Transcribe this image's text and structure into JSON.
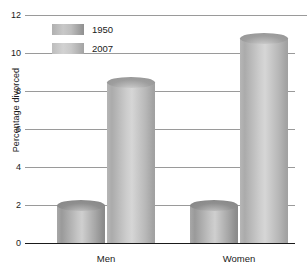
{
  "chart_data": {
    "type": "bar",
    "title": "",
    "subtitle": "",
    "xlabel": "",
    "ylabel": "Percentage divorced",
    "categories": [
      "Men",
      "Women"
    ],
    "series": [
      {
        "name": "1950",
        "values": [
          2.0,
          2.0
        ],
        "color": "#a5a5a5"
      },
      {
        "name": "2007",
        "values": [
          8.5,
          10.8
        ],
        "color": "#bfbfbf"
      }
    ],
    "ylim": [
      0,
      12
    ],
    "yticks": [
      0,
      2,
      4,
      6,
      8,
      10,
      12
    ],
    "ytick_labels": [
      "0",
      "2",
      "4",
      "6",
      "8",
      "10",
      "12"
    ],
    "grid": true,
    "legend_position": "top-left",
    "legend_entries": [
      "1950",
      "2007"
    ]
  },
  "axis": {
    "y_title": "Percentage divorced"
  }
}
